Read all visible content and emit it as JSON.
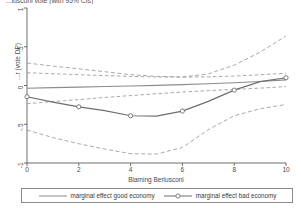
{
  "chart_data": {
    "type": "line",
    "title": "...lusconi vote (with 95% CIs)",
    "xlabel": "Blaming Berlusconi",
    "ylabel": "...r (vote DP)",
    "xlim": [
      0,
      10
    ],
    "ylim": [
      -1,
      1
    ],
    "xticks": [
      "0",
      "2",
      "4",
      "6",
      "8",
      "10"
    ],
    "xtick_values": [
      0,
      2,
      4,
      6,
      8,
      10
    ],
    "yticks": [
      "1",
      ".5",
      "0",
      "-.5",
      "-1"
    ],
    "ytick_values": [
      1,
      0.5,
      0,
      -0.5,
      -1
    ],
    "grid": false,
    "legend_position": "bottom",
    "x": [
      0,
      1,
      2,
      3,
      4,
      5,
      6,
      7,
      8,
      9,
      10
    ],
    "series": [
      {
        "name": "marginal effect good economy",
        "style": "solid",
        "marker": "none",
        "color": "#8c8c8c",
        "values": [
          -0.035,
          -0.028,
          -0.021,
          -0.013,
          -0.006,
          0.002,
          0.012,
          0.023,
          0.036,
          0.052,
          0.072
        ],
        "ci_upper": [
          0.165,
          0.152,
          0.14,
          0.128,
          0.118,
          0.11,
          0.108,
          0.112,
          0.122,
          0.138,
          0.158
        ],
        "ci_lower": [
          -0.235,
          -0.208,
          -0.182,
          -0.154,
          -0.13,
          -0.106,
          -0.084,
          -0.066,
          -0.05,
          -0.034,
          -0.014
        ]
      },
      {
        "name": "marginal effect bad economy",
        "style": "solid",
        "marker": "circle",
        "color": "#6e6e6e",
        "values": [
          -0.145,
          -0.215,
          -0.275,
          -0.325,
          -0.39,
          -0.395,
          -0.33,
          -0.205,
          -0.06,
          0.05,
          0.1
        ],
        "ci_upper": [
          0.29,
          0.25,
          0.215,
          0.178,
          0.14,
          0.118,
          0.11,
          0.15,
          0.262,
          0.43,
          0.64
        ],
        "ci_lower": [
          -0.575,
          -0.672,
          -0.752,
          -0.82,
          -0.88,
          -0.885,
          -0.8,
          -0.57,
          -0.39,
          -0.3,
          -0.245
        ]
      }
    ],
    "legend": [
      {
        "label": "marginal effect good economy",
        "marker": "none"
      },
      {
        "label": "marginal effect bad economy",
        "marker": "circle"
      }
    ]
  },
  "colors": {
    "axis": "#4a4a4a",
    "good": "#8c8c8c",
    "bad": "#6e6e6e",
    "ci": "#9a9a9a"
  }
}
